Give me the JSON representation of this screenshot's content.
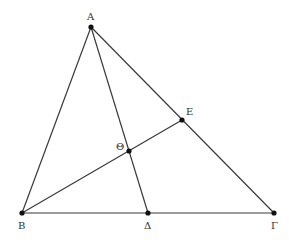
{
  "diagram": {
    "type": "geometry",
    "stroke_color": "#3a3a3a",
    "point_color": "#111111",
    "points": [
      {
        "id": "A",
        "label": "Α",
        "x": 91,
        "y": 27,
        "lx": 87,
        "ly": 20
      },
      {
        "id": "B",
        "label": "Β",
        "x": 22,
        "y": 213,
        "lx": 18,
        "ly": 229
      },
      {
        "id": "D",
        "label": "Δ",
        "x": 148,
        "y": 213,
        "lx": 144,
        "ly": 229
      },
      {
        "id": "G",
        "label": "Γ",
        "x": 274,
        "y": 213,
        "lx": 271,
        "ly": 229
      },
      {
        "id": "E",
        "label": "Ε",
        "x": 182,
        "y": 120,
        "lx": 186,
        "ly": 115
      },
      {
        "id": "TH",
        "label": "Θ",
        "x": 129,
        "y": 151,
        "lx": 116,
        "ly": 150
      }
    ],
    "segments": [
      {
        "from": "A",
        "to": "B"
      },
      {
        "from": "A",
        "to": "G"
      },
      {
        "from": "B",
        "to": "G"
      },
      {
        "from": "A",
        "to": "D"
      },
      {
        "from": "B",
        "to": "E"
      }
    ]
  }
}
